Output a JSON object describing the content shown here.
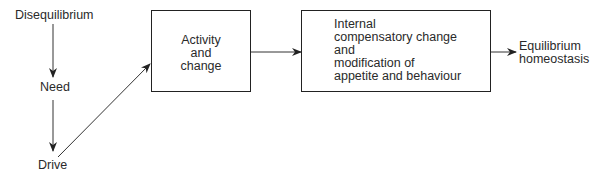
{
  "diagram": {
    "nodes": {
      "disequilibrium": "Disequilibrium",
      "need": "Need",
      "drive": "Drive",
      "activity_box": [
        "Activity",
        "and",
        "change"
      ],
      "internal_box": [
        "Internal",
        "compensatory change",
        "and",
        "modification of",
        "appetite and behaviour"
      ],
      "equilibrium": [
        "Equilibrium",
        "homeostasis"
      ]
    },
    "edges": [
      {
        "from": "Disequilibrium",
        "to": "Need"
      },
      {
        "from": "Need",
        "to": "Drive"
      },
      {
        "from": "Drive",
        "to": "Activity and change"
      },
      {
        "from": "Activity and change",
        "to": "Internal compensatory change and modification of appetite and behaviour"
      },
      {
        "from": "Internal compensatory change and modification of appetite and behaviour",
        "to": "Equilibrium homeostasis"
      }
    ]
  }
}
